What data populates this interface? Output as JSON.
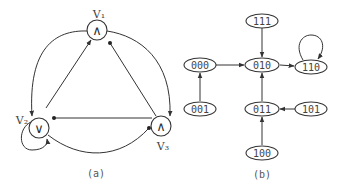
{
  "figure_a": {
    "caption": "(a)",
    "nodes": [
      {
        "id": "v1",
        "label": "V₁",
        "gate": "∧"
      },
      {
        "id": "v2",
        "label": "V₂",
        "gate": "∨"
      },
      {
        "id": "v3",
        "label": "V₃",
        "gate": "∧"
      }
    ],
    "edges": [
      {
        "from": "v2",
        "to": "v1",
        "type": "activation"
      },
      {
        "from": "v3",
        "to": "v1",
        "type": "inhibition"
      },
      {
        "from": "v1",
        "to": "v2",
        "type": "activation"
      },
      {
        "from": "v1",
        "to": "v3",
        "type": "activation"
      },
      {
        "from": "v3",
        "to": "v2",
        "type": "inhibition"
      },
      {
        "from": "v2",
        "to": "v3",
        "type": "inhibition"
      },
      {
        "from": "v2",
        "to": "v2",
        "type": "activation"
      }
    ]
  },
  "figure_b": {
    "caption": "(b)",
    "states": [
      "111",
      "000",
      "010",
      "110",
      "001",
      "011",
      "101",
      "100"
    ],
    "transitions": [
      {
        "from": "111",
        "to": "010"
      },
      {
        "from": "000",
        "to": "010"
      },
      {
        "from": "010",
        "to": "110"
      },
      {
        "from": "110",
        "to": "110"
      },
      {
        "from": "001",
        "to": "000"
      },
      {
        "from": "011",
        "to": "010"
      },
      {
        "from": "101",
        "to": "011"
      },
      {
        "from": "100",
        "to": "011"
      }
    ]
  }
}
